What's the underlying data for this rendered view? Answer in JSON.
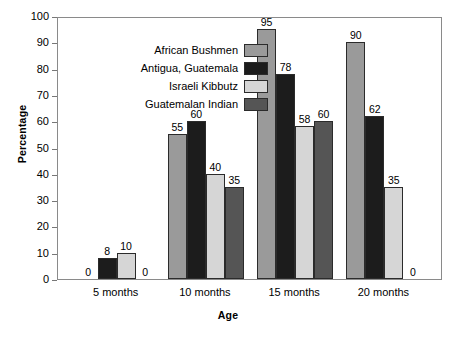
{
  "chart_data": {
    "type": "bar",
    "title": "",
    "xlabel": "Age",
    "ylabel": "Percentage",
    "categories": [
      "5 months",
      "10 months",
      "15 months",
      "20 months"
    ],
    "ylim": [
      0,
      100
    ],
    "ytick_values": [
      0,
      10,
      20,
      30,
      40,
      50,
      60,
      70,
      80,
      90,
      100
    ],
    "grid": false,
    "legend_position": "upper-left-inside",
    "show_data_labels": true,
    "series": [
      {
        "name": "African Bushmen",
        "color": "#9a9a9a",
        "values": [
          0,
          55,
          95,
          90
        ]
      },
      {
        "name": "Antigua, Guatemala",
        "color": "#1c1c1c",
        "values": [
          8,
          60,
          78,
          62
        ]
      },
      {
        "name": "Israeli Kibbutz",
        "color": "#d6d6d6",
        "values": [
          10,
          40,
          58,
          35
        ]
      },
      {
        "name": "Guatemalan Indian",
        "color": "#555555",
        "values": [
          0,
          35,
          60,
          0
        ]
      }
    ]
  }
}
